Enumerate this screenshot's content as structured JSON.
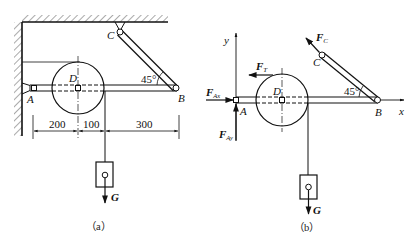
{
  "figure_a": {
    "caption": "（a）",
    "points": {
      "A": "A",
      "B": "B",
      "C": "C",
      "D": "D"
    },
    "angle_label": "45°",
    "dimensions": [
      "200",
      "100",
      "300"
    ],
    "load_label": "G"
  },
  "figure_b": {
    "caption": "（b）",
    "points": {
      "A": "A",
      "B": "B",
      "C": "C",
      "D": "D"
    },
    "angle_label": "45°",
    "axes": {
      "x": "x",
      "y": "y"
    },
    "forces": {
      "fc": {
        "main": "F",
        "sub": "C"
      },
      "ft": {
        "main": "F",
        "sub": "T"
      },
      "fax": {
        "main": "F",
        "sub": "Ax"
      },
      "fay": {
        "main": "F",
        "sub": "Ay"
      }
    },
    "load_label": "G"
  },
  "colors": {
    "ink": "#111111",
    "background": "#ffffff"
  }
}
